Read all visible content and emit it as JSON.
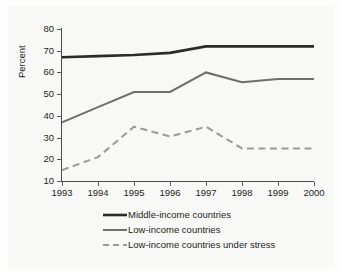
{
  "chart_data": {
    "type": "line",
    "title": "",
    "subtitle": "",
    "xlabel": "",
    "ylabel": "Percent",
    "categories": [
      "1993",
      "1994",
      "1995",
      "1996",
      "1997",
      "1998",
      "1999",
      "2000"
    ],
    "x": [
      1993,
      1994,
      1995,
      1996,
      1997,
      1998,
      1999,
      2000
    ],
    "xlim": [
      1993,
      2000
    ],
    "ylim": [
      10,
      80
    ],
    "yticks": [
      10,
      20,
      30,
      40,
      50,
      60,
      70,
      80
    ],
    "ytick_labels": [
      "10",
      "20",
      "30",
      "40",
      "50",
      "60",
      "70",
      "80"
    ],
    "grid": false,
    "legend_position": "below-plot-left",
    "series": [
      {
        "name": "Middle-income countries",
        "values": [
          67,
          67.5,
          68,
          69,
          72,
          72,
          72,
          72
        ],
        "color": "#2b2b2b",
        "style": "solid",
        "width": 2.6
      },
      {
        "name": "Low-income countries",
        "values": [
          37,
          44,
          51,
          51,
          60,
          55.5,
          57,
          57
        ],
        "color": "#6e6e6e",
        "style": "solid",
        "width": 2.0
      },
      {
        "name": "Low-income countries under stress",
        "values": [
          15,
          21,
          35,
          30.5,
          35,
          25,
          25,
          25
        ],
        "color": "#9a9a9a",
        "style": "dashed",
        "width": 2.0
      }
    ]
  },
  "legend": {
    "entries": [
      {
        "label": "Middle-income countries"
      },
      {
        "label": "Low-income countries"
      },
      {
        "label": "Low-income countries under stress"
      }
    ]
  },
  "axes": {
    "y_label": "Percent"
  },
  "colors": {
    "background": "#f8f8f7",
    "axis": "#4c4c4c",
    "text": "#231f20",
    "series_1": "#2b2b2b",
    "series_2": "#6e6e6e",
    "series_3": "#9a9a9a"
  }
}
